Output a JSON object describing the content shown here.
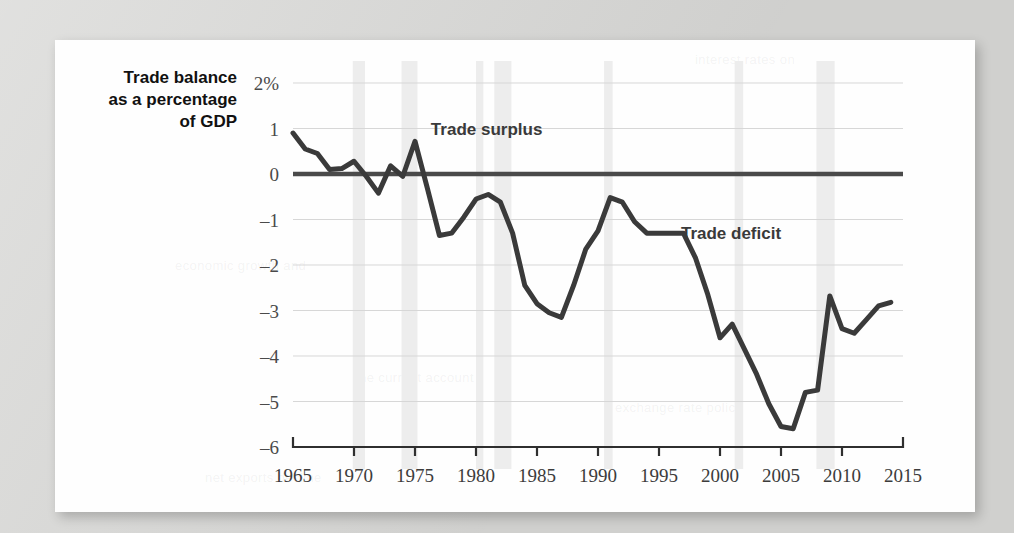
{
  "figure": {
    "background_color": "#d9d9d7",
    "card_color": "#fefefe",
    "line_color": "#3a3a3a",
    "grid_color": "#d7d7d7",
    "recession_band_color": "#ededed"
  },
  "axis_title": {
    "line1": "Trade balance",
    "line2": "as a percentage",
    "line3": "of GDP"
  },
  "annotations": {
    "surplus": "Trade surplus",
    "deficit": "Trade deficit"
  },
  "chart_data": {
    "type": "line",
    "title": "",
    "subtitle": "",
    "xlabel": "",
    "ylabel": "Trade balance as a percentage of GDP",
    "xlim": [
      1965,
      2015
    ],
    "ylim": [
      -6,
      2
    ],
    "grid": true,
    "legend": "none",
    "ytick_labels": [
      "2%",
      "1",
      "0",
      "-1",
      "-2",
      "-3",
      "-4",
      "-5",
      "-6"
    ],
    "ytick_values": [
      2,
      1,
      0,
      -1,
      -2,
      -3,
      -4,
      -5,
      -6
    ],
    "xtick_labels": [
      "1965",
      "1970",
      "1975",
      "1980",
      "1985",
      "1990",
      "1995",
      "2000",
      "2005",
      "2010",
      "2015"
    ],
    "xtick_values": [
      1965,
      1970,
      1975,
      1980,
      1985,
      1990,
      1995,
      2000,
      2005,
      2010,
      2015
    ],
    "zero_reference_line": 0,
    "series": [
      {
        "name": "Trade balance (% of GDP)",
        "x": [
          1965,
          1966,
          1967,
          1968,
          1969,
          1970,
          1971,
          1972,
          1973,
          1974,
          1975,
          1976,
          1977,
          1978,
          1979,
          1980,
          1981,
          1982,
          1983,
          1984,
          1985,
          1986,
          1987,
          1988,
          1989,
          1990,
          1991,
          1992,
          1993,
          1994,
          1995,
          1996,
          1997,
          1998,
          1999,
          2000,
          2001,
          2002,
          2003,
          2004,
          2005,
          2006,
          2007,
          2008,
          2009,
          2010,
          2011,
          2012,
          2013,
          2014
        ],
        "values": [
          0.9,
          0.55,
          0.45,
          0.1,
          0.12,
          0.28,
          -0.05,
          -0.42,
          0.18,
          -0.05,
          0.72,
          -0.3,
          -1.35,
          -1.3,
          -0.95,
          -0.55,
          -0.45,
          -0.62,
          -1.3,
          -2.45,
          -2.85,
          -3.05,
          -3.15,
          -2.45,
          -1.65,
          -1.25,
          -0.52,
          -0.62,
          -1.05,
          -1.3,
          -1.3,
          -1.3,
          -1.3,
          -1.85,
          -2.65,
          -3.6,
          -3.3,
          -3.85,
          -4.4,
          -5.05,
          -5.55,
          -5.6,
          -4.8,
          -4.75,
          -2.68,
          -3.4,
          -3.5,
          -3.2,
          -2.9,
          -2.82
        ]
      }
    ],
    "recession_bands": [
      {
        "start": 1969.9,
        "end": 1970.9
      },
      {
        "start": 1973.9,
        "end": 1975.2
      },
      {
        "start": 1980.0,
        "end": 1980.6
      },
      {
        "start": 1981.5,
        "end": 1982.9
      },
      {
        "start": 1990.5,
        "end": 1991.2
      },
      {
        "start": 2001.2,
        "end": 2001.9
      },
      {
        "start": 2007.9,
        "end": 2009.4
      }
    ],
    "annotations": [
      {
        "text": "Trade surplus",
        "x": 1976.3,
        "y": 1.0
      },
      {
        "text": "Trade deficit",
        "x": 1996.8,
        "y": -1.3
      }
    ]
  },
  "ghost_text": {
    "g1": "interest rates on",
    "g2": "economic growth and",
    "g3": "the current account",
    "g4": "exchange rate policy",
    "g5": "net exports decline"
  }
}
